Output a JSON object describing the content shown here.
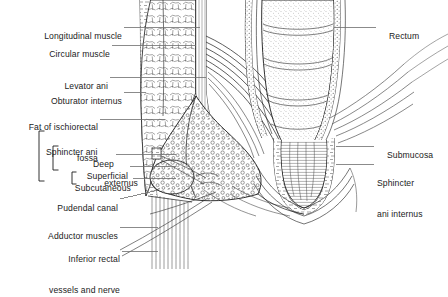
{
  "figure": {
    "type": "anatomical-illustration",
    "style": "black-and-white line drawing with stipple and hatch shading",
    "background_color": "#ffffff",
    "ink_color": "#1b1b1b",
    "leader_color": "#6e6e6e"
  },
  "labels_left": [
    {
      "id": "longitudinal-muscle",
      "text": "Longitudinal muscle",
      "lines": [
        "Longitudinal muscle"
      ]
    },
    {
      "id": "circular-muscle",
      "text": "Circular muscle",
      "lines": [
        "Circular muscle"
      ]
    },
    {
      "id": "levator-ani",
      "text": "Levator ani",
      "lines": [
        "Levator ani"
      ]
    },
    {
      "id": "obturator-internus",
      "text": "Obturator internus",
      "lines": [
        "Obturator internus"
      ]
    },
    {
      "id": "fat-of-ischiorectal-fossa",
      "text": "Fat of ischiorectal fossa",
      "lines": [
        "Fat of ischiorectal",
        "fossa"
      ]
    },
    {
      "id": "sphincter-ani-externus",
      "text": "Sphincter ani externus",
      "lines": [
        "Sphincter ani",
        "externus"
      ]
    },
    {
      "id": "deep",
      "text": "Deep",
      "lines": [
        "Deep"
      ]
    },
    {
      "id": "superficial",
      "text": "Superficial",
      "lines": [
        "Superficial"
      ]
    },
    {
      "id": "subcutaneous",
      "text": "Subcutaneous",
      "lines": [
        "Subcutaneous"
      ]
    },
    {
      "id": "pudendal-canal",
      "text": "Pudendal canal",
      "lines": [
        "Pudendal canal"
      ]
    },
    {
      "id": "adductor-muscles",
      "text": "Adductor muscles",
      "lines": [
        "Adductor muscles"
      ]
    },
    {
      "id": "inferior-rectal-vessels-and-nerve",
      "text": "Inferior rectal vessels and nerve",
      "lines": [
        "Inferior rectal",
        "vessels and nerve"
      ]
    }
  ],
  "labels_right": [
    {
      "id": "rectum",
      "text": "Rectum",
      "lines": [
        "Rectum"
      ]
    },
    {
      "id": "submucosa",
      "text": "Submucosa",
      "lines": [
        "Submucosa"
      ]
    },
    {
      "id": "sphincter-ani-internus",
      "text": "Sphincter ani internus",
      "lines": [
        "Sphincter",
        "ani internus"
      ]
    }
  ]
}
